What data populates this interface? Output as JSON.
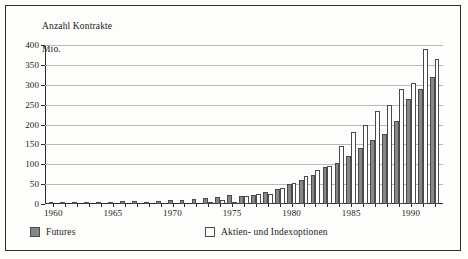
{
  "chart_data": {
    "type": "bar",
    "title": "Anzahl Kontrakte\nMio.",
    "title_line1": "Anzahl Kontrakte",
    "title_line2": "Mio.",
    "xlabel": "",
    "ylabel": "Anzahl Kontrakte Mio.",
    "ylim": [
      0,
      400
    ],
    "yticks": [
      0,
      50,
      100,
      150,
      200,
      250,
      300,
      350,
      400
    ],
    "ytick_labels": [
      "0",
      "50",
      "100",
      "150",
      "200",
      "250",
      "300",
      "350",
      "400"
    ],
    "xlim": [
      1959.3,
      1992.7
    ],
    "xticks": [
      1960,
      1965,
      1970,
      1975,
      1980,
      1985,
      1990
    ],
    "xtick_labels": [
      "1960",
      "1965",
      "1970",
      "1975",
      "1980",
      "1985",
      "1990"
    ],
    "grid": "horizontal",
    "legend_position": "below-axes",
    "categories": [
      1960,
      1961,
      1962,
      1963,
      1964,
      1965,
      1966,
      1967,
      1968,
      1969,
      1970,
      1971,
      1972,
      1973,
      1974,
      1975,
      1976,
      1977,
      1978,
      1979,
      1980,
      1981,
      1982,
      1983,
      1984,
      1985,
      1986,
      1987,
      1988,
      1989,
      1990,
      1991,
      1992
    ],
    "series": [
      {
        "name": "Futures",
        "color": "#878787",
        "values": [
          4,
          3,
          4,
          5,
          4,
          5,
          7,
          7,
          6,
          8,
          9,
          10,
          13,
          14,
          18,
          23,
          19,
          23,
          30,
          37,
          50,
          61,
          74,
          93,
          103,
          120,
          140,
          160,
          175,
          210,
          265,
          290,
          320
        ]
      },
      {
        "name": "Aktien- und Indexoptionen",
        "color": "#ffffff",
        "values": [
          0,
          0,
          0,
          0,
          0,
          0,
          0,
          0,
          0,
          0,
          0,
          0,
          0,
          4,
          9,
          6,
          20,
          26,
          24,
          40,
          54,
          70,
          85,
          95,
          145,
          180,
          200,
          235,
          250,
          290,
          305,
          390,
          365
        ]
      }
    ]
  },
  "legend": {
    "items": [
      {
        "label": "Futures",
        "swatch": "filled-gray-swatch"
      },
      {
        "label": "Aktien- und Indexoptionen",
        "swatch": "white-swatch"
      }
    ]
  },
  "colors": {
    "futures": "#878787",
    "options": "#ffffff",
    "bar_outline": "#4a4a4a",
    "gridline": "#b9b9b9",
    "axis": "#2b2b2b",
    "background": "#fdfdfb"
  }
}
